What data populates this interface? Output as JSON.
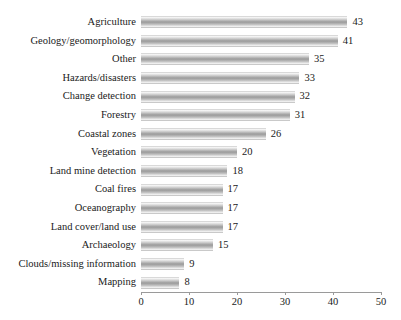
{
  "chart_data": {
    "type": "bar",
    "orientation": "horizontal",
    "title": "",
    "subtitle": "",
    "xlabel": "",
    "ylabel": "",
    "xlim": [
      0,
      50
    ],
    "xticks": [
      0,
      10,
      20,
      30,
      40,
      50
    ],
    "grid": false,
    "legend": false,
    "legend_position": "none",
    "data_labels": true,
    "bar_color": "#9b9b9b",
    "categories": [
      "Agriculture",
      "Geology/geomorphology",
      "Other",
      "Hazards/disasters",
      "Change detection",
      "Forestry",
      "Coastal zones",
      "Vegetation",
      "Land mine detection",
      "Coal fires",
      "Oceanography",
      "Land cover/land use",
      "Archaeology",
      "Clouds/missing information",
      "Mapping"
    ],
    "values": [
      43,
      41,
      35,
      33,
      32,
      31,
      26,
      20,
      18,
      17,
      17,
      17,
      15,
      9,
      8
    ]
  }
}
